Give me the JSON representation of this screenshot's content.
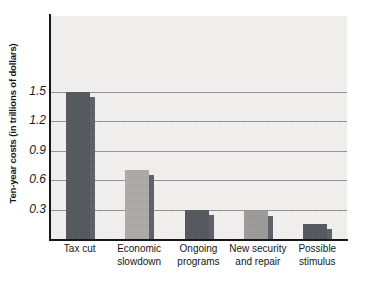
{
  "chart_data": {
    "type": "bar",
    "title": "",
    "xlabel": "",
    "ylabel": "Ten-year costs (in trillions of dollars)",
    "categories": [
      "Tax cut",
      "Economic\nslowdown",
      "Ongoing\nprograms",
      "New security\nand repair",
      "Possible\nstimulus"
    ],
    "values": [
      1.5,
      0.7,
      0.3,
      0.29,
      0.15
    ],
    "ylim": [
      0,
      1.5
    ],
    "ytick_labels": [
      "1.5",
      "1.2",
      "0.9",
      "0.6",
      "0.3"
    ],
    "ytick_values": [
      1.5,
      1.2,
      0.9,
      0.6,
      0.3
    ],
    "grid": "horizontal",
    "legend": "none",
    "bar_colors": [
      "#54575d",
      "#acaaa7",
      "#54575d",
      "#9b9a98",
      "#54575d"
    ],
    "bar_shadow_color": "#5d6066",
    "plot_background": "#f2f1ef",
    "axis_color": "#16171b",
    "gridline_color": "#8e9195"
  }
}
